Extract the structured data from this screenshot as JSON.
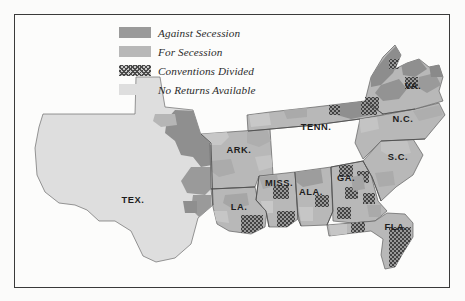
{
  "map": {
    "title": "Secession Convention Voting Map",
    "background_color": "#fbfbfa",
    "frame_color": "#3a3a3a"
  },
  "legend": {
    "items": [
      {
        "label": "Against Secession",
        "swatch": "dark-gray-swatch",
        "color": "#9a9a9a",
        "pattern": "solid"
      },
      {
        "label": "For Secession",
        "swatch": "medium-gray-swatch",
        "color": "#b8b8b8",
        "pattern": "solid"
      },
      {
        "label": "Conventions Divided",
        "swatch": "crosshatch-swatch",
        "color": "#4a4a4a",
        "pattern": "crosshatch"
      },
      {
        "label": "No Returns Available",
        "swatch": "light-gray-swatch",
        "color": "#dedede",
        "pattern": "solid"
      }
    ]
  },
  "states": [
    {
      "name": "TEX.",
      "x": 118,
      "y": 185
    },
    {
      "name": "ARK.",
      "x": 224,
      "y": 135
    },
    {
      "name": "LA.",
      "x": 224,
      "y": 192
    },
    {
      "name": "MISS.",
      "x": 264,
      "y": 168
    },
    {
      "name": "ALA.",
      "x": 296,
      "y": 177
    },
    {
      "name": "TENN.",
      "x": 301,
      "y": 112
    },
    {
      "name": "GA.",
      "x": 331,
      "y": 163
    },
    {
      "name": "FLA.",
      "x": 381,
      "y": 212
    },
    {
      "name": "S.C.",
      "x": 383,
      "y": 142
    },
    {
      "name": "N.C.",
      "x": 388,
      "y": 104
    },
    {
      "name": "VA.",
      "x": 398,
      "y": 71
    }
  ]
}
